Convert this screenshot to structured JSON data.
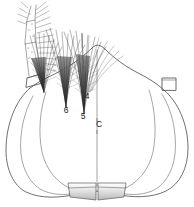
{
  "figure": {
    "background_color": "#ffffff",
    "ink_color": "#4a4a4a",
    "shading_color": "#c8c8c8",
    "width": 194,
    "height": 207
  },
  "labels": [
    {
      "id": "label-6",
      "text": "6",
      "x": 66,
      "y": 113,
      "kind": "numeric"
    },
    {
      "id": "label-5",
      "text": "5",
      "x": 83,
      "y": 119,
      "kind": "numeric"
    },
    {
      "id": "label-4",
      "text": "4",
      "x": 87,
      "y": 99,
      "kind": "numeric"
    },
    {
      "id": "label-c",
      "text": "C",
      "x": 99,
      "y": 127,
      "kind": "letter"
    }
  ],
  "structures": {
    "body_outline_label": "abdomen-outline",
    "left_lobe_label": "left-lateral-lobe",
    "right_lobe_label": "right-lateral-lobe",
    "midline_label": "median-line",
    "left_socket_label": "left-appendage-socket",
    "right_socket_label": "right-appendage-socket",
    "left_plate_label": "left-terminal-plate",
    "right_plate_label": "right-terminal-plate",
    "appendage_label": "segmented-appendage",
    "tuft_count": 4
  }
}
